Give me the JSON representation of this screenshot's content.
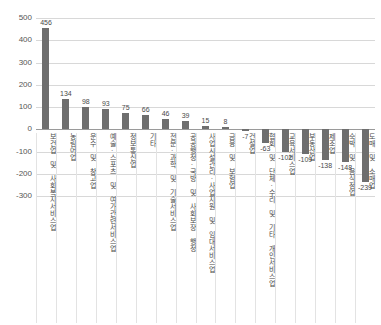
{
  "chart_data": {
    "type": "bar",
    "title": "",
    "subtitle": "",
    "xlabel": "",
    "ylabel": "",
    "ylim": [
      -300,
      500
    ],
    "ytick_step": 100,
    "yticks": [
      "500",
      "400",
      "300",
      "200",
      "100",
      "0",
      "-100",
      "-200",
      "-300"
    ],
    "grid": true,
    "legend": "none",
    "bar_color": "#6e6e6e",
    "zero_line_color": "#9a9a9a",
    "gridline_color": "#d8d8d8",
    "categories": [
      "보건업 및 사회복지서비스업",
      "농림어업",
      "운수 및 창고업",
      "예술·스포츠 및 여가관련서비스업",
      "정보통신업",
      "기타",
      "전문·과학 및 기술서비스업",
      "공공행정·국방 및 사회보장 행정",
      "사업시설관리·사업지원 및 임대서비스업",
      "금융 및 보험업",
      "건설업",
      "협회 및 단체·수리 및 기타 개인서비스업",
      "교육서비스업",
      "부동산업",
      "제조업",
      "숙박 및 음식점업",
      "도매 및 소매업"
    ],
    "values": [
      456,
      134,
      98,
      93,
      75,
      66,
      46,
      39,
      15,
      8,
      -7,
      -63,
      -102,
      -109,
      -138,
      -148,
      -239
    ],
    "value_labels": [
      "456",
      "134",
      "98",
      "93",
      "75",
      "66",
      "46",
      "39",
      "15",
      "8",
      "-7",
      "-63",
      "-102",
      "-109",
      "-138",
      "-148",
      "-239"
    ]
  }
}
